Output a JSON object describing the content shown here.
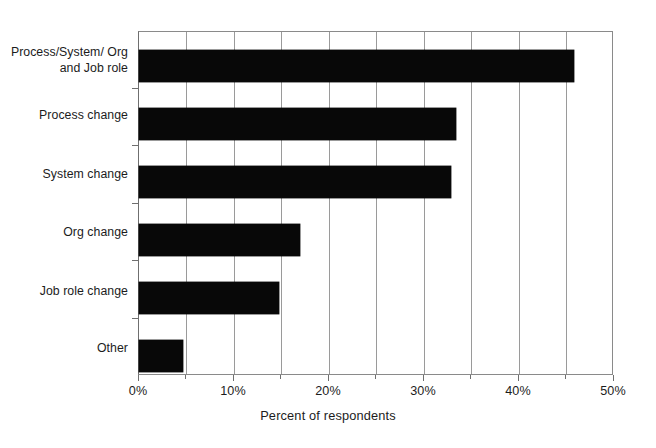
{
  "chart_data": {
    "type": "bar",
    "orientation": "horizontal",
    "title": "",
    "xlabel": "Percent of respondents",
    "ylabel": "",
    "categories": [
      "Process/System/\nOrg and Job role",
      "Process change",
      "System change",
      "Org change",
      "Job role change",
      "Other"
    ],
    "values": [
      46,
      33.5,
      33,
      17,
      14.8,
      4.7
    ],
    "xlim": [
      0,
      50
    ],
    "xticks": [
      0,
      10,
      20,
      30,
      40,
      50
    ],
    "xtick_labels": [
      "0%",
      "10%",
      "20%",
      "30%",
      "40%",
      "50%"
    ],
    "minor_xticks": [
      5,
      15,
      25,
      35,
      45
    ],
    "grid": true,
    "grid_axis": "x",
    "grid_interval": 5,
    "legend": false,
    "bar_color": "#080808",
    "grid_color": "#9a9a9a",
    "axis_color": "#6f6f6f",
    "background_color": "#ffffff"
  },
  "axis": {
    "x_title": "Percent of respondents"
  }
}
